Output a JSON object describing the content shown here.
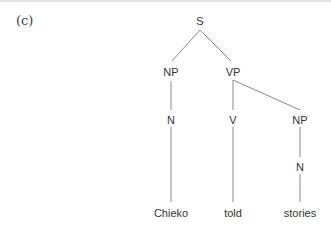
{
  "figure": {
    "label": "(c)",
    "nodes": {
      "S": "S",
      "NP_subject": "NP",
      "VP": "VP",
      "N_subject": "N",
      "V": "V",
      "NP_object": "NP",
      "N_object": "N"
    },
    "words": {
      "subject": "Chieko",
      "verb": "told",
      "object": "stories"
    },
    "colors": {
      "line": "#8a8a8a",
      "text": "#333333"
    }
  }
}
